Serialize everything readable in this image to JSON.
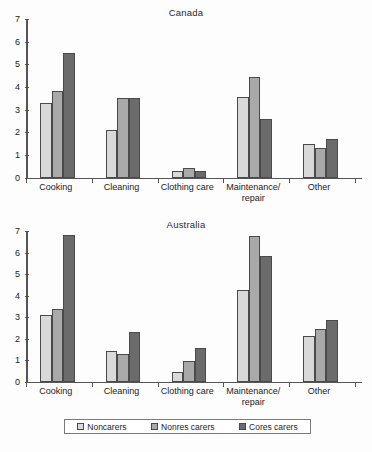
{
  "figure": {
    "legend": {
      "items": [
        {
          "label": "Noncarers",
          "color": "#d9d9d9",
          "swatch_name": "legend-swatch-noncarers"
        },
        {
          "label": "Nonres carers",
          "color": "#a9a9a9",
          "swatch_name": "legend-swatch-nonres-carers"
        },
        {
          "label": "Cores carers",
          "color": "#6b6b6b",
          "swatch_name": "legend-swatch-cores-carers"
        }
      ]
    }
  },
  "chart_data": [
    {
      "type": "bar",
      "title": "Canada",
      "xlabel": "",
      "ylabel": "",
      "ylim": [
        0,
        7
      ],
      "yticks": [
        0,
        1,
        2,
        3,
        4,
        5,
        6,
        7
      ],
      "ytick_labels": [
        "0",
        "1",
        "2",
        "3",
        "4",
        "5",
        "6",
        "7"
      ],
      "grid": false,
      "legend_position": "bottom",
      "categories": [
        "Cooking",
        "Cleaning",
        "Clothing care",
        "Maintenance/\nrepair",
        "Other"
      ],
      "series": [
        {
          "name": "Noncarers",
          "color": "#d9d9d9",
          "values": [
            3.3,
            2.1,
            0.3,
            3.55,
            1.5
          ]
        },
        {
          "name": "Nonres carers",
          "color": "#a9a9a9",
          "values": [
            3.8,
            3.5,
            0.4,
            4.45,
            1.3
          ]
        },
        {
          "name": "Cores carers",
          "color": "#6b6b6b",
          "values": [
            5.5,
            3.5,
            0.3,
            2.6,
            1.7
          ]
        }
      ]
    },
    {
      "type": "bar",
      "title": "Australia",
      "xlabel": "",
      "ylabel": "",
      "ylim": [
        0,
        7
      ],
      "yticks": [
        0,
        1,
        2,
        3,
        4,
        5,
        6,
        7
      ],
      "ytick_labels": [
        "0",
        "1",
        "2",
        "3",
        "4",
        "5",
        "6",
        "7"
      ],
      "grid": false,
      "legend_position": "bottom",
      "categories": [
        "Cooking",
        "Cleaning",
        "Clothing care",
        "Maintenance/\nrepair",
        "Other"
      ],
      "series": [
        {
          "name": "Noncarers",
          "color": "#d9d9d9",
          "values": [
            3.1,
            1.4,
            0.45,
            4.25,
            2.1
          ]
        },
        {
          "name": "Nonres carers",
          "color": "#a9a9a9",
          "values": [
            3.35,
            1.3,
            0.95,
            6.75,
            2.45
          ]
        },
        {
          "name": "Cores carers",
          "color": "#6b6b6b",
          "values": [
            6.8,
            2.3,
            1.55,
            5.85,
            2.85
          ]
        }
      ]
    }
  ]
}
